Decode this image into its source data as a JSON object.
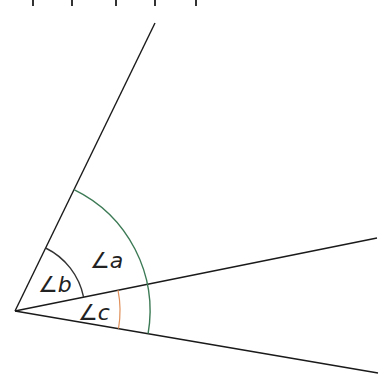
{
  "diagram": {
    "vertex": {
      "x": 15,
      "y": 311
    },
    "rays": [
      {
        "name": "upper-ray",
        "end": {
          "x": 155,
          "y": 23
        }
      },
      {
        "name": "middle-ray",
        "end": {
          "x": 377,
          "y": 238
        }
      },
      {
        "name": "lower-ray",
        "end": {
          "x": 378,
          "y": 373
        }
      }
    ],
    "angles": [
      {
        "label": "∠a",
        "arc_radius": 135,
        "arc_color": "#3c7a55",
        "from": "upper-ray",
        "to": "lower-ray"
      },
      {
        "label": "∠b",
        "arc_radius": 70,
        "arc_color": "#333333",
        "from": "upper-ray",
        "to": "middle-ray"
      },
      {
        "label": "∠c",
        "arc_radius": 105,
        "arc_color": "#e0905a",
        "from": "middle-ray",
        "to": "lower-ray"
      }
    ],
    "line_color": "#1a1a1a"
  }
}
